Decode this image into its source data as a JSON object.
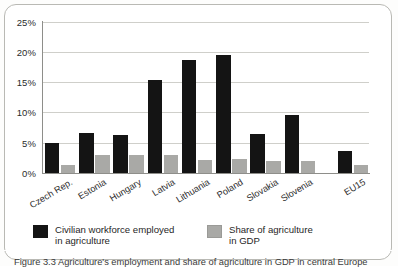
{
  "figure": {
    "caption": "Figure 3.3  Agriculture's employment and share of agriculture in GDP in central Europe",
    "frame_color": "#b9b9b4"
  },
  "chart_data": {
    "type": "bar",
    "title": "",
    "xlabel": "",
    "ylabel": "",
    "ylim": [
      0,
      25
    ],
    "grid": true,
    "legend_position": "bottom",
    "ytick_labels": [
      "0%",
      "5%",
      "10%",
      "15%",
      "20%",
      "25%"
    ],
    "ytick_values": [
      0,
      5,
      10,
      15,
      20,
      25
    ],
    "categories": [
      "Czech Rep.",
      "Estonia",
      "Hungary",
      "Latvia",
      "Lithuania",
      "Poland",
      "Slovakia",
      "Slovenia",
      "EU15"
    ],
    "series": [
      {
        "name": "Civilian workforce employed in agriculture",
        "color": "#141414",
        "values": [
          4.9,
          6.6,
          6.2,
          15.3,
          18.6,
          19.5,
          6.5,
          9.6,
          3.6
        ]
      },
      {
        "name": "Share of agriculture in GDP",
        "color": "#a9a9a6",
        "values": [
          1.4,
          3.0,
          3.0,
          2.9,
          2.1,
          2.4,
          2.0,
          2.0,
          1.3
        ]
      }
    ],
    "legend": [
      {
        "label": "Civilian workforce employed\nin agriculture",
        "color": "#141414"
      },
      {
        "label": "Share of agriculture\nin GDP",
        "color": "#a9a9a6"
      }
    ]
  }
}
